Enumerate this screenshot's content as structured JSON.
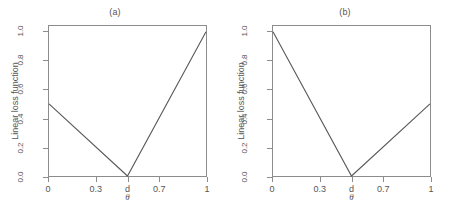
{
  "figure": {
    "background": "#ffffff",
    "line_color": "#595959",
    "axis_color": "#8c8c8c",
    "text_color": "#555555"
  },
  "chart_data": [
    {
      "type": "line",
      "title": "(a)",
      "xlabel": "θ",
      "ylabel": "Linear loss function",
      "xlim": [
        0,
        1
      ],
      "ylim": [
        0,
        1.04
      ],
      "grid": false,
      "legend": null,
      "x_ticks": [
        {
          "value": 0,
          "label": "0"
        },
        {
          "value": 0.3,
          "label": "0.3"
        },
        {
          "value": 0.5,
          "label": "d"
        },
        {
          "value": 0.7,
          "label": "0.7"
        },
        {
          "value": 1,
          "label": "1"
        }
      ],
      "y_ticks": [
        {
          "value": 0.0,
          "label": "0.0"
        },
        {
          "value": 0.2,
          "label": "0.2"
        },
        {
          "value": 0.4,
          "label": "0.4"
        },
        {
          "value": 0.6,
          "label": "0.6"
        },
        {
          "value": 0.8,
          "label": "0.8"
        },
        {
          "value": 1.0,
          "label": "1.0"
        }
      ],
      "series": [
        {
          "name": "linear loss",
          "x": [
            0,
            0.5,
            1
          ],
          "values": [
            0.5,
            0.0,
            1.0
          ]
        }
      ]
    },
    {
      "type": "line",
      "title": "(b)",
      "xlabel": "θ",
      "ylabel": "Linear loss function",
      "xlim": [
        0,
        1
      ],
      "ylim": [
        0,
        1.04
      ],
      "grid": false,
      "legend": null,
      "x_ticks": [
        {
          "value": 0,
          "label": "0"
        },
        {
          "value": 0.3,
          "label": "0.3"
        },
        {
          "value": 0.5,
          "label": "d"
        },
        {
          "value": 0.7,
          "label": "0.7"
        },
        {
          "value": 1,
          "label": "1"
        }
      ],
      "y_ticks": [
        {
          "value": 0.0,
          "label": "0.0"
        },
        {
          "value": 0.2,
          "label": "0.2"
        },
        {
          "value": 0.4,
          "label": "0.4"
        },
        {
          "value": 0.6,
          "label": "0.6"
        },
        {
          "value": 0.8,
          "label": "0.8"
        },
        {
          "value": 1.0,
          "label": "1.0"
        }
      ],
      "series": [
        {
          "name": "linear loss",
          "x": [
            0,
            0.5,
            1
          ],
          "values": [
            1.0,
            0.0,
            0.5
          ]
        }
      ]
    }
  ]
}
